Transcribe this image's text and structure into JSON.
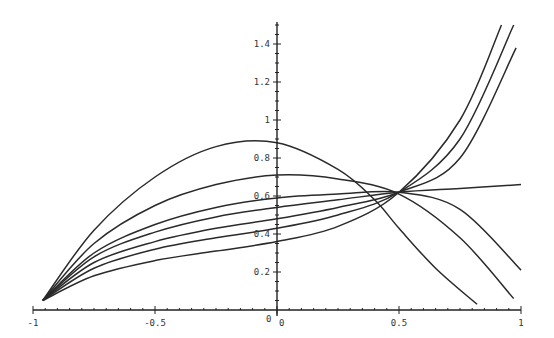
{
  "chart_data": {
    "type": "line",
    "title": "",
    "xlabel": "",
    "ylabel": "",
    "xlim": [
      -1,
      1
    ],
    "ylim": [
      0,
      1.5
    ],
    "grid": false,
    "legend": null,
    "x_ticks": [
      -1,
      -0.5,
      0,
      0.5,
      1
    ],
    "x_tick_labels": [
      "-1",
      "-0.5",
      "0",
      "0.5",
      "1"
    ],
    "y_ticks": [
      0.2,
      0.4,
      0.6,
      0.8,
      1,
      1.2,
      1.4
    ],
    "y_tick_labels": [
      "0.2",
      "0.4",
      "0.6",
      "0.8",
      "1",
      "1.2",
      "1.4"
    ],
    "x": [
      -0.96,
      -0.75,
      -0.5,
      -0.25,
      0,
      0.25,
      0.5,
      0.75,
      1
    ],
    "series": [
      {
        "name": "curve-1",
        "x": [
          -0.96,
          -0.75,
          -0.5,
          -0.25,
          0,
          0.25,
          0.4,
          0.5,
          0.65,
          0.82
        ],
        "values": [
          0.05,
          0.42,
          0.7,
          0.86,
          0.88,
          0.74,
          0.58,
          0.43,
          0.22,
          0.03
        ]
      },
      {
        "name": "curve-2",
        "x": [
          -0.96,
          -0.75,
          -0.5,
          -0.25,
          0,
          0.25,
          0.5,
          0.75,
          0.97
        ],
        "values": [
          0.05,
          0.35,
          0.55,
          0.66,
          0.71,
          0.69,
          0.61,
          0.38,
          0.06
        ]
      },
      {
        "name": "curve-3",
        "x": [
          -0.96,
          -0.75,
          -0.5,
          -0.25,
          0,
          0.25,
          0.5,
          0.75,
          1
        ],
        "values": [
          0.05,
          0.3,
          0.45,
          0.54,
          0.59,
          0.61,
          0.62,
          0.53,
          0.21
        ]
      },
      {
        "name": "curve-4",
        "x": [
          -0.96,
          -0.75,
          -0.5,
          -0.25,
          0,
          0.25,
          0.5,
          0.75,
          1
        ],
        "values": [
          0.05,
          0.28,
          0.41,
          0.49,
          0.54,
          0.58,
          0.62,
          0.64,
          0.66
        ]
      },
      {
        "name": "curve-5",
        "x": [
          -0.96,
          -0.75,
          -0.5,
          -0.25,
          0,
          0.25,
          0.5,
          0.75,
          0.98
        ],
        "values": [
          0.05,
          0.25,
          0.36,
          0.43,
          0.48,
          0.54,
          0.62,
          0.8,
          1.38
        ]
      },
      {
        "name": "curve-6",
        "x": [
          -0.96,
          -0.75,
          -0.5,
          -0.25,
          0,
          0.25,
          0.5,
          0.75,
          0.97
        ],
        "values": [
          0.05,
          0.22,
          0.32,
          0.38,
          0.43,
          0.5,
          0.62,
          0.9,
          1.5
        ]
      },
      {
        "name": "curve-7",
        "x": [
          -0.96,
          -0.75,
          -0.5,
          -0.25,
          0,
          0.25,
          0.5,
          0.75,
          0.92
        ],
        "values": [
          0.05,
          0.18,
          0.26,
          0.31,
          0.36,
          0.44,
          0.62,
          1.0,
          1.5
        ]
      }
    ]
  }
}
